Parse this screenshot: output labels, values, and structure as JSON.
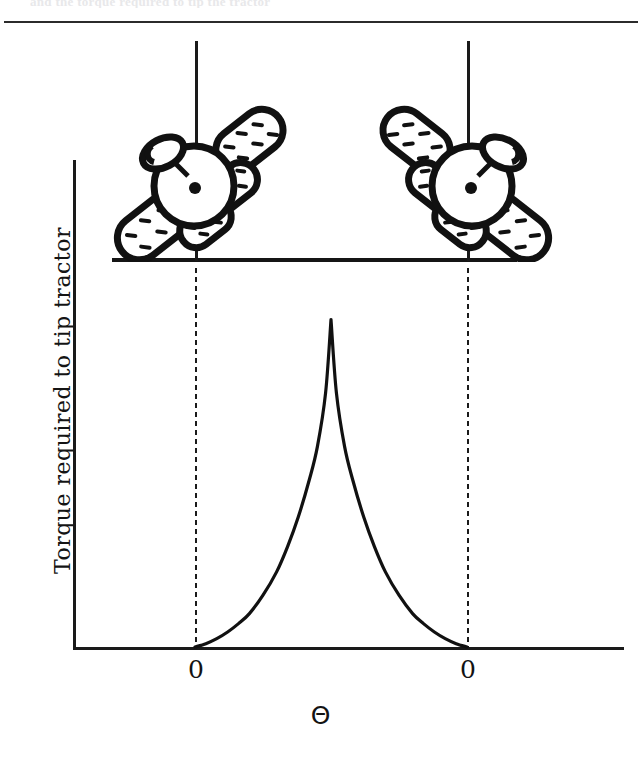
{
  "figure": {
    "top_clipped_text": "and the torque required to tip the tractor",
    "y_axis_label": "Torque required to tip tractor",
    "x_axis_label": "Θ",
    "tick_labels": [
      "0",
      "0"
    ],
    "colors": {
      "ink": "#1a1a1a",
      "paper": "#ffffff",
      "rule": "#2b2b2b"
    },
    "illustrations": [
      {
        "name": "tractor-tipped-left",
        "caption": ""
      },
      {
        "name": "tractor-tipped-right",
        "caption": ""
      }
    ]
  },
  "chart_data": {
    "type": "line",
    "title": "",
    "subtitle": "",
    "xlabel": "Θ",
    "ylabel": "Torque required to tip tractor",
    "grid": false,
    "legend": null,
    "annotations": [
      "Vertical dash-dot line at left tipping angle (labelled 0)",
      "Vertical dash-dot line at right tipping angle (labelled 0)",
      "Tractor pictogram tipped to the left above the left zero",
      "Tractor pictogram tipped to the right above the right zero"
    ],
    "xticks": [
      0.0,
      1.0
    ],
    "xticklabels": [
      "0",
      "0"
    ],
    "yticks": [],
    "yticklabels": [],
    "xlim": [
      -0.22,
      1.57
    ],
    "ylim": [
      0,
      1.0
    ],
    "series": [
      {
        "name": "Torque required to tip tractor",
        "description": "Zero at both tipping angles, rising to a sharp cusp peak midway between them",
        "x": [
          0.0,
          0.04,
          0.08,
          0.12,
          0.16,
          0.2,
          0.25,
          0.3,
          0.34,
          0.38,
          0.42,
          0.45,
          0.48,
          0.5,
          0.52,
          0.55,
          0.58,
          0.62,
          0.66,
          0.7,
          0.75,
          0.8,
          0.84,
          0.88,
          0.92,
          0.96,
          1.0
        ],
        "y": [
          0.0,
          0.01,
          0.025,
          0.045,
          0.07,
          0.1,
          0.155,
          0.225,
          0.3,
          0.39,
          0.5,
          0.6,
          0.76,
          0.98,
          0.76,
          0.6,
          0.5,
          0.39,
          0.3,
          0.225,
          0.155,
          0.1,
          0.07,
          0.045,
          0.025,
          0.01,
          0.0
        ]
      }
    ]
  }
}
